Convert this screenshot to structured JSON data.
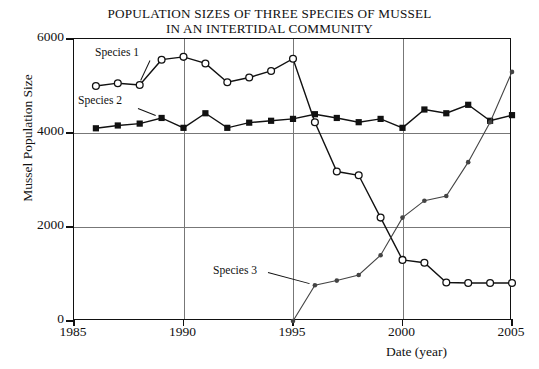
{
  "chart_data": {
    "type": "line",
    "title": "POPULATION SIZES OF THREE SPECIES OF MUSSEL IN AN INTERTIDAL COMMUNITY",
    "title_line1": "POPULATION SIZES OF THREE SPECIES OF MUSSEL",
    "title_line2": "IN AN INTERTIDAL COMMUNITY",
    "xlabel": "Date (year)",
    "ylabel": "Mussel Population Size",
    "xlim": [
      1985,
      2005
    ],
    "ylim": [
      0,
      6000
    ],
    "xticks": [
      1985,
      1990,
      1995,
      2000,
      2005
    ],
    "yticks": [
      0,
      2000,
      4000,
      6000
    ],
    "xtick_labels": [
      "1985",
      "1990",
      "1995",
      "2000",
      "2005"
    ],
    "ytick_labels": [
      "0",
      "2000",
      "4000",
      "6000"
    ],
    "grid": "both",
    "legend": "inline-annotations",
    "series": [
      {
        "name": "Species 1",
        "marker": "open-circle",
        "color": "#111111",
        "x": [
          1986,
          1987,
          1988,
          1989,
          1990,
          1991,
          1992,
          1993,
          1994,
          1995,
          1996,
          1997,
          1998,
          1999,
          2000,
          2001,
          2002,
          2003,
          2004,
          2005
        ],
        "values": [
          5000,
          5060,
          5020,
          5560,
          5620,
          5480,
          5080,
          5180,
          5320,
          5580,
          4230,
          3180,
          3100,
          2200,
          1300,
          1240,
          820,
          810,
          810,
          810
        ]
      },
      {
        "name": "Species 2",
        "marker": "filled-square",
        "color": "#111111",
        "x": [
          1986,
          1987,
          1988,
          1989,
          1990,
          1991,
          1992,
          1993,
          1994,
          1995,
          1996,
          1997,
          1998,
          1999,
          2000,
          2001,
          2002,
          2003,
          2004,
          2005
        ],
        "values": [
          4100,
          4160,
          4200,
          4320,
          4110,
          4420,
          4110,
          4220,
          4260,
          4300,
          4400,
          4320,
          4230,
          4300,
          4110,
          4500,
          4420,
          4600,
          4260,
          4380
        ]
      },
      {
        "name": "Species 3",
        "marker": "small-filled-circle",
        "color": "#444444",
        "x": [
          1995,
          1996,
          1997,
          1998,
          1999,
          2000,
          2001,
          2002,
          2003,
          2004,
          2005
        ],
        "values": [
          0,
          760,
          860,
          980,
          1400,
          2200,
          2560,
          2660,
          3380,
          4230,
          5300
        ]
      }
    ],
    "annotations": [
      {
        "label": "Species 1",
        "points_to_year": 1988,
        "points_to_value": 5020
      },
      {
        "label": "Species 2",
        "points_to_year": 1989,
        "points_to_value": 4320
      },
      {
        "label": "Species 3",
        "points_to_year": 1996,
        "points_to_value": 760
      }
    ]
  }
}
